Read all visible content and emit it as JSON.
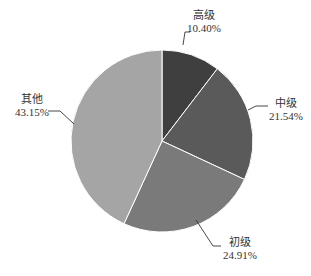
{
  "chart_data": {
    "type": "pie",
    "title": "",
    "categories": [
      "高级",
      "中级",
      "初级",
      "其他"
    ],
    "values": [
      10.4,
      21.54,
      24.91,
      43.15
    ],
    "value_labels": [
      "10.40%",
      "21.54%",
      "24.91%",
      "43.15%"
    ],
    "colors": [
      "#3f3f3f",
      "#5a5a5a",
      "#7a7a7a",
      "#a5a5a5"
    ],
    "start_angle_deg": 0,
    "direction": "clockwise",
    "legend": "none",
    "data_labels": "outside with leader lines"
  },
  "labels": {
    "gaoji": {
      "name": "高级",
      "pct": "10.40%"
    },
    "zhongji": {
      "name": "中级",
      "pct": "21.54%"
    },
    "chuji": {
      "name": "初级",
      "pct": "24.91%"
    },
    "qita": {
      "name": "其他",
      "pct": "43.15%"
    }
  }
}
